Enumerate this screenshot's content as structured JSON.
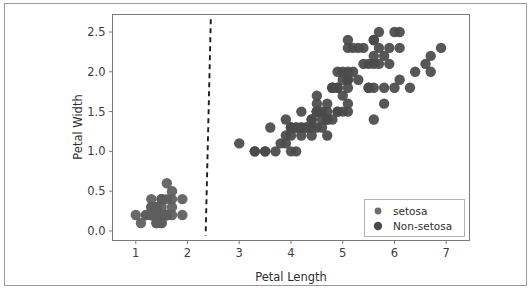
{
  "figure": {
    "background_color": "#ffffff",
    "border_color": "#9a9a9a",
    "axes_color": "#7a7a7a"
  },
  "chart_data": {
    "type": "scatter",
    "title": "",
    "xlabel": "Petal Length",
    "ylabel": "Petal Width",
    "xlim": [
      0.55,
      7.45
    ],
    "ylim": [
      -0.12,
      2.72
    ],
    "xticks": [
      "1",
      "2",
      "3",
      "4",
      "5",
      "6",
      "7"
    ],
    "xtick_values": [
      1,
      2,
      3,
      4,
      5,
      6,
      7
    ],
    "yticks": [
      "0.0",
      "0.5",
      "1.0",
      "1.5",
      "2.0",
      "2.5"
    ],
    "ytick_values": [
      0.0,
      0.5,
      1.0,
      1.5,
      2.0,
      2.5
    ],
    "grid": false,
    "legend_position": "lower right",
    "marker_color": "#595959",
    "marker_size": 5.2,
    "legend": [
      {
        "name": "setosa",
        "color": "#6e6e6e",
        "marker_size": 3.4
      },
      {
        "name": "Non-setosa",
        "color": "#4a4a4a",
        "marker_size": 4.2
      }
    ],
    "series": [
      {
        "name": "setosa",
        "color": "#5e5e5e",
        "x": [
          1.4,
          1.4,
          1.3,
          1.5,
          1.4,
          1.7,
          1.4,
          1.5,
          1.4,
          1.5,
          1.5,
          1.6,
          1.4,
          1.1,
          1.2,
          1.5,
          1.3,
          1.4,
          1.7,
          1.5,
          1.7,
          1.5,
          1.0,
          1.7,
          1.9,
          1.6,
          1.6,
          1.5,
          1.4,
          1.6,
          1.6,
          1.5,
          1.5,
          1.4,
          1.5,
          1.2,
          1.3,
          1.4,
          1.3,
          1.5,
          1.3,
          1.3,
          1.3,
          1.6,
          1.9,
          1.4,
          1.6,
          1.4,
          1.5,
          1.4
        ],
        "y": [
          0.2,
          0.2,
          0.2,
          0.2,
          0.2,
          0.4,
          0.3,
          0.2,
          0.2,
          0.1,
          0.2,
          0.2,
          0.1,
          0.1,
          0.2,
          0.4,
          0.4,
          0.3,
          0.3,
          0.3,
          0.2,
          0.4,
          0.2,
          0.5,
          0.2,
          0.2,
          0.4,
          0.2,
          0.2,
          0.2,
          0.2,
          0.4,
          0.1,
          0.2,
          0.2,
          0.2,
          0.2,
          0.1,
          0.2,
          0.2,
          0.3,
          0.3,
          0.2,
          0.6,
          0.4,
          0.3,
          0.2,
          0.2,
          0.2,
          0.2
        ]
      },
      {
        "name": "Non-setosa",
        "color": "#4a4a4a",
        "x": [
          4.7,
          4.5,
          4.9,
          4.0,
          4.6,
          4.5,
          4.7,
          3.3,
          4.6,
          3.9,
          3.5,
          4.2,
          4.0,
          4.7,
          3.6,
          4.4,
          4.5,
          4.1,
          4.5,
          3.9,
          4.8,
          4.0,
          4.9,
          4.7,
          4.3,
          4.4,
          4.8,
          5.0,
          4.5,
          3.5,
          3.8,
          3.7,
          3.9,
          5.1,
          4.5,
          4.5,
          4.7,
          4.4,
          4.1,
          4.0,
          4.4,
          4.6,
          4.0,
          3.3,
          4.2,
          4.2,
          4.2,
          4.3,
          3.0,
          4.1,
          6.0,
          5.1,
          5.9,
          5.6,
          5.8,
          6.6,
          4.5,
          6.3,
          5.8,
          6.1,
          5.1,
          5.3,
          5.5,
          5.0,
          5.1,
          5.3,
          5.5,
          6.7,
          6.9,
          5.0,
          5.7,
          4.9,
          6.7,
          4.9,
          5.7,
          6.0,
          4.8,
          4.9,
          5.6,
          5.8,
          6.1,
          6.4,
          5.6,
          5.1,
          5.6,
          6.1,
          5.6,
          5.5,
          4.8,
          5.4,
          5.6,
          5.1,
          5.1,
          5.9,
          5.7,
          5.2,
          5.0,
          5.2,
          5.4,
          5.1
        ],
        "y": [
          1.4,
          1.5,
          1.5,
          1.3,
          1.5,
          1.3,
          1.6,
          1.0,
          1.3,
          1.4,
          1.0,
          1.5,
          1.0,
          1.4,
          1.3,
          1.4,
          1.5,
          1.0,
          1.5,
          1.1,
          1.8,
          1.3,
          1.5,
          1.2,
          1.3,
          1.4,
          1.4,
          1.7,
          1.5,
          1.0,
          1.1,
          1.0,
          1.2,
          1.6,
          1.5,
          1.6,
          1.5,
          1.3,
          1.3,
          1.3,
          1.2,
          1.4,
          1.2,
          1.0,
          1.3,
          1.2,
          1.3,
          1.3,
          1.1,
          1.3,
          2.5,
          1.9,
          2.1,
          1.8,
          2.2,
          2.1,
          1.7,
          1.8,
          1.8,
          2.5,
          2.0,
          1.9,
          2.1,
          2.0,
          2.4,
          2.3,
          1.8,
          2.2,
          2.3,
          1.5,
          2.3,
          2.0,
          2.0,
          1.8,
          2.1,
          1.8,
          1.8,
          1.8,
          2.1,
          1.6,
          1.9,
          2.0,
          2.2,
          1.5,
          1.4,
          2.3,
          2.4,
          1.8,
          1.8,
          2.1,
          2.4,
          2.3,
          1.9,
          2.3,
          2.5,
          2.3,
          1.9,
          2.0,
          2.3,
          1.8
        ]
      }
    ],
    "annotations": [
      {
        "name": "decision-boundary",
        "type": "dashed-line",
        "style": "dashed",
        "color": "#1c1c1c",
        "x_top": 2.45,
        "y_top": 2.66,
        "x_bottom": 2.35,
        "y_bottom": -0.06
      }
    ]
  }
}
